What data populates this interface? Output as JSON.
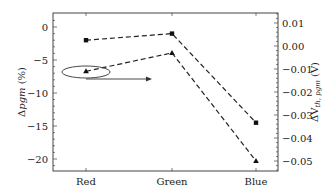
{
  "chart_data": {
    "type": "line",
    "title": "",
    "categories": [
      "Red",
      "Green",
      "Blue"
    ],
    "xlabel": "",
    "ylabel_left": "Δpgm (%)",
    "ylabel_right": "ΔV_th,pgm (V)",
    "ylim_left": [
      -22,
      1.5
    ],
    "ylim_right": [
      -0.055,
      0.015
    ],
    "yticks_left": [
      "0",
      "−5",
      "−10",
      "−15",
      "−20"
    ],
    "yticks_right": [
      "0.01",
      "0.00",
      "−0.01",
      "−0.02",
      "−0.03",
      "−0.04",
      "−0.05"
    ],
    "grid": false,
    "series": [
      {
        "name": "Δpgm (%)",
        "axis": "left",
        "marker": "square",
        "line": "dashed",
        "values": [
          -2.0,
          -1.0,
          -14.5
        ]
      },
      {
        "name": "ΔV_th,pgm (V)",
        "axis": "right",
        "marker": "triangle",
        "line": "dashed",
        "values": [
          -0.011,
          -0.003,
          -0.05
        ]
      }
    ],
    "annotations": [
      {
        "type": "ellipse",
        "target": "Red triangle point",
        "note": "indicates series read on right axis"
      },
      {
        "type": "arrow",
        "direction": "right",
        "note": "points toward right y-axis"
      }
    ]
  },
  "axes": {
    "left_label_main": "Δ",
    "left_label_italic": "pgm",
    "left_label_unit": " (%)",
    "right_label_main": "ΔV",
    "right_label_sub": "th, pgm",
    "right_label_unit": " (V)"
  }
}
